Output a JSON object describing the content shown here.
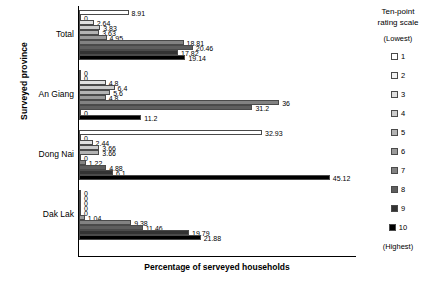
{
  "chart_data": {
    "type": "bar",
    "orientation": "horizontal",
    "title": "",
    "xlabel": "Percentage of serveyed households",
    "ylabel": "Surveyed province",
    "xlim": [
      0,
      50
    ],
    "grid": false,
    "categories": [
      "Total",
      "An Giang",
      "Dong Nai",
      "Dak Lak"
    ],
    "legend_position": "right",
    "series": [
      {
        "name": "1",
        "label": "1",
        "color": "#ffffff",
        "values": [
          8.91,
          0,
          32.93,
          0
        ]
      },
      {
        "name": "2",
        "label": "2",
        "color": "#f2f2f2",
        "values": [
          0,
          0,
          0,
          0
        ]
      },
      {
        "name": "3",
        "label": "3",
        "color": "#e0e0e0",
        "values": [
          2.64,
          4.8,
          2.44,
          0
        ]
      },
      {
        "name": "4",
        "label": "4",
        "color": "#cccccc",
        "values": [
          3.83,
          6.4,
          3.66,
          0
        ]
      },
      {
        "name": "5",
        "label": "5",
        "color": "#b3b3b3",
        "values": [
          3.63,
          5.6,
          3.66,
          0
        ]
      },
      {
        "name": "6",
        "label": "6",
        "color": "#9a9a9a",
        "values": [
          4.95,
          4.8,
          0,
          1.04
        ]
      },
      {
        "name": "7",
        "label": "7",
        "color": "#828282",
        "values": [
          18.81,
          36,
          1.22,
          9.38
        ]
      },
      {
        "name": "8",
        "label": "8",
        "color": "#5e5e5e",
        "values": [
          20.46,
          31.2,
          4.88,
          11.46
        ]
      },
      {
        "name": "9",
        "label": "9",
        "color": "#333333",
        "values": [
          17.82,
          0,
          6.1,
          19.79
        ]
      },
      {
        "name": "10",
        "label": "10",
        "color": "#000000",
        "values": [
          19.14,
          11.2,
          45.12,
          21.88
        ]
      }
    ],
    "group_values": {
      "Total": [
        8.91,
        0,
        2.64,
        3.83,
        3.63,
        4.95,
        18.81,
        20.46,
        17.82,
        19.14
      ],
      "An Giang": [
        0,
        0,
        4.8,
        6.4,
        5.6,
        4.8,
        36,
        31.2,
        0,
        11.2
      ],
      "Dong Nai": [
        32.93,
        0,
        2.44,
        3.66,
        3.66,
        0,
        1.22,
        4.88,
        6.1,
        45.12
      ],
      "Dak Lak": [
        0,
        0,
        0,
        0,
        0,
        1.04,
        9.38,
        11.46,
        19.79,
        21.88
      ]
    }
  },
  "axes": {
    "y_title": "Surveyed province",
    "x_title": "Percentage of serveyed households",
    "categories": [
      "Total",
      "An Giang",
      "Dong Nai",
      "Dak Lak"
    ]
  },
  "legend": {
    "title_line1": "Ten-point",
    "title_line2": "rating scale",
    "lowest_caption": "(Lowest)",
    "highest_caption": "(Highest)",
    "items": [
      {
        "label": "1",
        "color": "#ffffff"
      },
      {
        "label": "2",
        "color": "#f2f2f2"
      },
      {
        "label": "3",
        "color": "#e0e0e0"
      },
      {
        "label": "4",
        "color": "#cccccc"
      },
      {
        "label": "5",
        "color": "#b3b3b3"
      },
      {
        "label": "6",
        "color": "#9a9a9a"
      },
      {
        "label": "7",
        "color": "#828282"
      },
      {
        "label": "8",
        "color": "#5e5e5e"
      },
      {
        "label": "9",
        "color": "#333333"
      },
      {
        "label": "10",
        "color": "#000000"
      }
    ]
  }
}
